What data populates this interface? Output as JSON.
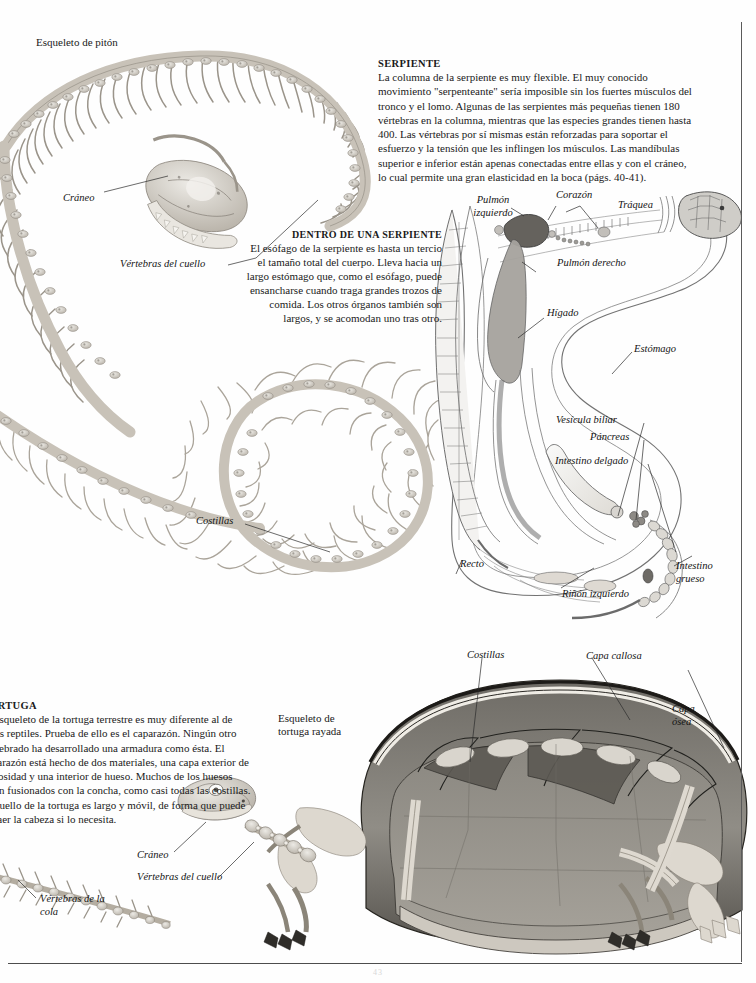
{
  "page": {
    "language": "es",
    "folio": "43",
    "background_color": "#ffffff",
    "rule_color": "#4d4d4d"
  },
  "captions": {
    "python_skeleton": "Esqueleto de pitón",
    "tortoise_skeleton": "Esqueleto de tortuga rayada"
  },
  "text_blocks": {
    "serpiente": {
      "heading": "SERPIENTE",
      "body": "La columna de la serpiente es muy flexible. El muy conocido movimiento \"serpenteante\" sería imposible sin los fuertes músculos del tronco y el lomo. Algunas de las serpientes más pequeñas tienen 180 vértebras en la columna, mientras que las especies grandes tienen hasta 400. Las vértebras por sí mismas están reforzadas para soportar el esfuerzo y la tensión que les inflingen los músculos. Las mandíbulas superior e inferior están apenas conectadas entre ellas y con el cráneo, lo cual permite una gran elasticidad en la boca (págs. 40-41)."
    },
    "dentro_de_una_serpiente": {
      "heading": "DENTRO DE UNA SERPIENTE",
      "body": "El esófago de la serpiente es hasta un tercio el tamaño total del cuerpo. Lleva hacia un largo estómago que, como el esófago, puede ensancharse cuando traga grandes trozos de comida. Los otros órganos también son largos, y se acomodan uno tras otro."
    },
    "tortuga": {
      "heading": "TORTUGA",
      "body": "El esqueleto de la tortuga terrestre es muy diferente al de otros reptiles. Prueba de ello es el caparazón. Ningún otro vertebrado ha desarrollado una armadura como ésta. El caparazón está hecho de dos materiales, una capa exterior de callosidad y una interior de hueso. Muchos de los huesos están fusionados con la concha, como casi todas las costillas. El cuello de la tortuga es largo y móvil, de forma que puede retraer la cabeza si lo necesita."
    }
  },
  "labels": {
    "python": {
      "skull": "Cráneo",
      "neck_vertebrae": "Vértebras del cuello",
      "ribs": "Costillas"
    },
    "snake_organs": {
      "left_lung": "Pulmón izquierdo",
      "heart": "Corazón",
      "trachea": "Tráquea",
      "right_lung": "Pulmón derecho",
      "liver": "Hígado",
      "stomach": "Estómago",
      "gall_bladder": "Vesícula biliar",
      "pancreas": "Páncreas",
      "small_intestine": "Intestino delgado",
      "rectum": "Recto",
      "left_kidney": "Riñón izquierdo",
      "large_intestine": "Intestino grueso"
    },
    "tortoise": {
      "ribs": "Costillas",
      "horny_layer": "Capa callosa",
      "bony_layer": "Capa ósea",
      "skull": "Cráneo",
      "neck_vertebrae": "Vértebras del cuello",
      "tail_vertebrae": "Vértebras de la cola"
    }
  }
}
